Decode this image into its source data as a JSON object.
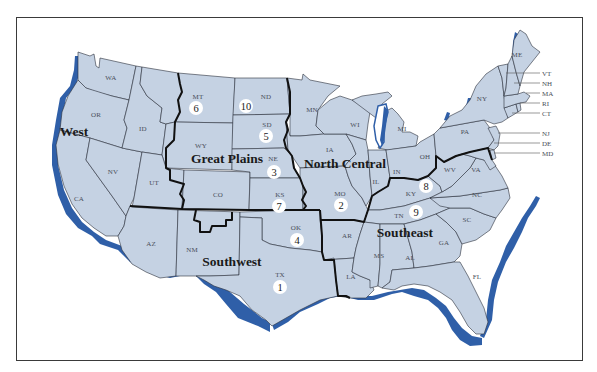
{
  "map": {
    "title": "",
    "colors": {
      "land": "#c5d2e3",
      "coast_shadow": "#2f5fa8",
      "state_border": "#2a2f3a",
      "region_border": "#111111",
      "frame": "#3a3a3a"
    },
    "regions": [
      {
        "id": "west",
        "label": "West",
        "x": 74,
        "y": 136
      },
      {
        "id": "great-plains",
        "label": "Great Plains",
        "x": 227,
        "y": 163
      },
      {
        "id": "north-central",
        "label": "North Central",
        "x": 345,
        "y": 168
      },
      {
        "id": "southwest",
        "label": "Southwest",
        "x": 232,
        "y": 266
      },
      {
        "id": "southeast",
        "label": "Southeast",
        "x": 405,
        "y": 237
      }
    ],
    "states": [
      {
        "abbr": "WA",
        "x": 111,
        "y": 80
      },
      {
        "abbr": "OR",
        "x": 96,
        "y": 117
      },
      {
        "abbr": "ID",
        "x": 143,
        "y": 131
      },
      {
        "abbr": "MT",
        "x": 198,
        "y": 99
      },
      {
        "abbr": "ND",
        "x": 266,
        "y": 99
      },
      {
        "abbr": "SD",
        "x": 267,
        "y": 127
      },
      {
        "abbr": "WY",
        "x": 201,
        "y": 148
      },
      {
        "abbr": "NE",
        "x": 273,
        "y": 161
      },
      {
        "abbr": "NV",
        "x": 113,
        "y": 174
      },
      {
        "abbr": "UT",
        "x": 154,
        "y": 185
      },
      {
        "abbr": "CO",
        "x": 218,
        "y": 197
      },
      {
        "abbr": "KS",
        "x": 280,
        "y": 197
      },
      {
        "abbr": "CA",
        "x": 79,
        "y": 201
      },
      {
        "abbr": "AZ",
        "x": 151,
        "y": 246
      },
      {
        "abbr": "NM",
        "x": 192,
        "y": 252
      },
      {
        "abbr": "OK",
        "x": 296,
        "y": 230
      },
      {
        "abbr": "TX",
        "x": 280,
        "y": 277
      },
      {
        "abbr": "MN",
        "x": 312,
        "y": 112
      },
      {
        "abbr": "WI",
        "x": 355,
        "y": 127
      },
      {
        "abbr": "MI",
        "x": 402,
        "y": 131
      },
      {
        "abbr": "IA",
        "x": 330,
        "y": 152
      },
      {
        "abbr": "IL",
        "x": 376,
        "y": 184
      },
      {
        "abbr": "IN",
        "x": 397,
        "y": 174
      },
      {
        "abbr": "OH",
        "x": 425,
        "y": 159
      },
      {
        "abbr": "MO",
        "x": 340,
        "y": 196
      },
      {
        "abbr": "KY",
        "x": 411,
        "y": 196
      },
      {
        "abbr": "WV",
        "x": 450,
        "y": 172
      },
      {
        "abbr": "VA",
        "x": 476,
        "y": 172
      },
      {
        "abbr": "NC",
        "x": 477,
        "y": 197
      },
      {
        "abbr": "TN",
        "x": 399,
        "y": 218
      },
      {
        "abbr": "SC",
        "x": 467,
        "y": 222
      },
      {
        "abbr": "AR",
        "x": 347,
        "y": 238
      },
      {
        "abbr": "MS",
        "x": 379,
        "y": 258
      },
      {
        "abbr": "AL",
        "x": 410,
        "y": 260
      },
      {
        "abbr": "GA",
        "x": 444,
        "y": 245
      },
      {
        "abbr": "LA",
        "x": 351,
        "y": 279
      },
      {
        "abbr": "FL",
        "x": 477,
        "y": 279
      },
      {
        "abbr": "PA",
        "x": 465,
        "y": 134
      },
      {
        "abbr": "NY",
        "x": 482,
        "y": 101
      },
      {
        "abbr": "ME",
        "x": 517,
        "y": 57
      }
    ],
    "callouts": [
      {
        "abbr": "VT",
        "y": 73
      },
      {
        "abbr": "NH",
        "y": 83
      },
      {
        "abbr": "MA",
        "y": 93
      },
      {
        "abbr": "RI",
        "y": 103
      },
      {
        "abbr": "CT",
        "y": 113
      },
      {
        "abbr": "NJ",
        "y": 133
      },
      {
        "abbr": "DE",
        "y": 143
      },
      {
        "abbr": "MD",
        "y": 153
      }
    ],
    "markers": [
      {
        "number": "1",
        "x": 280,
        "y": 287
      },
      {
        "number": "2",
        "x": 341,
        "y": 205
      },
      {
        "number": "3",
        "x": 274,
        "y": 172
      },
      {
        "number": "4",
        "x": 297,
        "y": 240
      },
      {
        "number": "5",
        "x": 266,
        "y": 136
      },
      {
        "number": "6",
        "x": 196,
        "y": 108
      },
      {
        "number": "7",
        "x": 279,
        "y": 206
      },
      {
        "number": "8",
        "x": 426,
        "y": 186
      },
      {
        "number": "9",
        "x": 416,
        "y": 212
      },
      {
        "number": "10",
        "x": 246,
        "y": 106
      }
    ]
  }
}
